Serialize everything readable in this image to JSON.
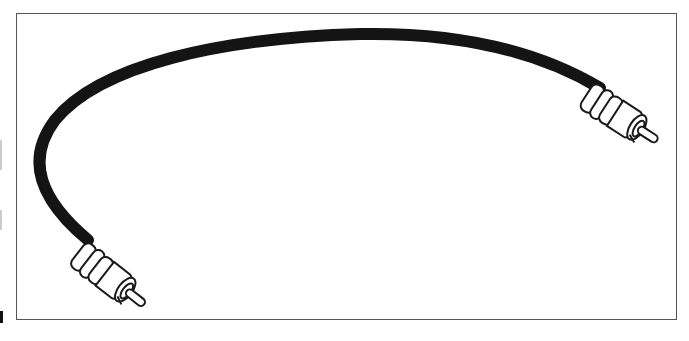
{
  "figure": {
    "alt": "Line illustration of an RCA audio cable with a plug at each end",
    "colors": {
      "cable": "#141414",
      "outline": "#1a1a1a",
      "frame": "#555555",
      "background": "#ffffff"
    }
  }
}
